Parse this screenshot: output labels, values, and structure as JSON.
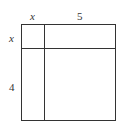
{
  "diagram": {
    "type": "area-model",
    "top_labels": [
      "x",
      "5"
    ],
    "side_labels": [
      "x",
      "4"
    ],
    "line_color": "#333333"
  }
}
